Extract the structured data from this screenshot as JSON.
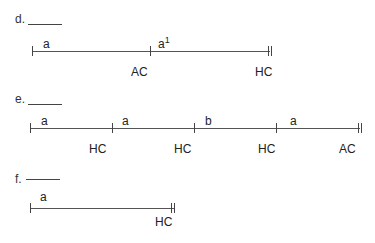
{
  "problems": [
    {
      "id": "d",
      "header": "d.",
      "answer_blank": "",
      "segments": [
        {
          "label": "a",
          "superscript": ""
        },
        {
          "label": "a",
          "superscript": "1"
        }
      ],
      "tick_labels": [
        "AC",
        "HC"
      ]
    },
    {
      "id": "e",
      "header": "e.",
      "answer_blank": "",
      "segments": [
        {
          "label": "a",
          "superscript": ""
        },
        {
          "label": "a",
          "superscript": ""
        },
        {
          "label": "b",
          "superscript": ""
        },
        {
          "label": "a",
          "superscript": ""
        }
      ],
      "tick_labels": [
        "HC",
        "HC",
        "HC",
        "AC"
      ]
    },
    {
      "id": "f",
      "header": "f.",
      "answer_blank": "",
      "segments": [
        {
          "label": "a",
          "superscript": ""
        }
      ],
      "tick_labels": [
        "HC"
      ]
    }
  ],
  "colors": {
    "line": "#555555",
    "text": "#222222",
    "background": "#ffffff"
  }
}
